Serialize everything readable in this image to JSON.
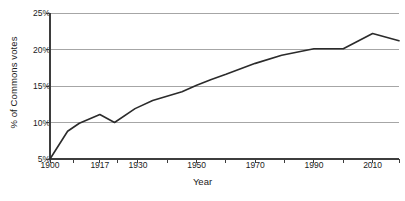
{
  "chart_data": {
    "type": "line",
    "title": "",
    "xlabel": "Year",
    "ylabel": "% of Commons votes",
    "xlim": [
      1900,
      2019
    ],
    "ylim": [
      5,
      25
    ],
    "grid": true,
    "grid_axis": "y",
    "legend": false,
    "legend_position": "none",
    "line_color": "#2b2b2b",
    "grid_color": "#a6a6a6",
    "axis_color": "#3d3d3d",
    "y_ticks": [
      5,
      10,
      15,
      20,
      25
    ],
    "y_tick_labels": [
      "5%",
      "10%",
      "15%",
      "20%",
      "25%"
    ],
    "x_ticks": [
      1900,
      1917,
      1930,
      1950,
      1970,
      1990,
      2010
    ],
    "x_tick_labels": [
      "1900",
      "1917",
      "1930",
      "1950",
      "1970",
      "1990",
      "2010"
    ],
    "x_minor_ticks": [
      1908,
      1923,
      1940,
      1960,
      1980,
      2000,
      2019
    ],
    "series": [
      {
        "name": "% of Commons votes",
        "x": [
          1900,
          1906,
          1910,
          1917,
          1922,
          1929,
          1935,
          1945,
          1950,
          1955,
          1960,
          1970,
          1979,
          1990,
          2000,
          2010,
          2019
        ],
        "values": [
          5.0,
          8.8,
          9.9,
          11.1,
          10.0,
          11.9,
          13.0,
          14.2,
          15.1,
          15.9,
          16.6,
          18.1,
          19.2,
          20.1,
          20.1,
          22.2,
          21.2
        ]
      }
    ],
    "annotations": []
  },
  "axis": {
    "y_title": "% of Commons votes",
    "x_title": "Year"
  }
}
